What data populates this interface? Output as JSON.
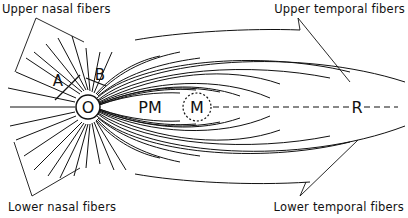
{
  "diagram": {
    "type": "retinal nerve fiber layout",
    "labels": {
      "upper_nasal": "Upper nasal fibers",
      "upper_temporal": "Upper temporal fibers",
      "lower_nasal": "Lower nasal fibers",
      "lower_temporal": "Lower temporal fibers"
    },
    "markers": {
      "optic_disc": "O",
      "papillomacular": "PM",
      "macula": "M",
      "raphe": "R",
      "a": "A",
      "b": "B"
    },
    "colors": {
      "stroke": "#111111",
      "background": "#ffffff"
    }
  }
}
